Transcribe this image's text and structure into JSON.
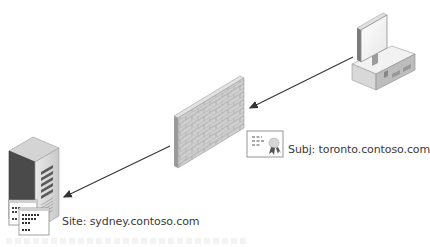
{
  "diagram": {
    "nodes": {
      "client": {
        "icon": "desktop-computer-icon"
      },
      "firewall": {
        "icon": "brick-firewall-icon"
      },
      "server": {
        "icon": "tower-server-icon"
      },
      "certificate": {
        "icon": "certificate-icon"
      },
      "site_pages": {
        "icon": "web-pages-icon"
      }
    },
    "labels": {
      "certificate_subject": "Subj: toronto.contoso.com",
      "server_site": "Site: sydney.contoso.com"
    },
    "arrows": [
      {
        "from": "client",
        "to": "firewall"
      },
      {
        "from": "firewall",
        "to": "server"
      }
    ],
    "colors": {
      "line": "#3a3a3a",
      "text": "#3a3a3a",
      "brick": "#c8c8c8",
      "server_dark": "#4a4a4a",
      "monitor": "#bdbdbd"
    }
  }
}
